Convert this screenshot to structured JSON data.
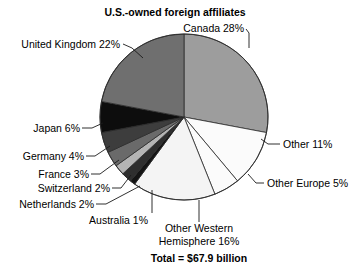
{
  "chart_data": {
    "type": "pie",
    "title": "U.S.-owned foreign affiliates",
    "total_label": "Total = $67.9 billion",
    "total_value": 67.9,
    "total_units": "billion dollars",
    "units": "percent",
    "start_angle_deg": 0,
    "direction": "clockwise",
    "categories": [
      "Canada",
      "Other",
      "Other Europe",
      "Other Western Hemisphere",
      "Australia",
      "Netherlands",
      "Switzerland",
      "France",
      "Germany",
      "Japan",
      "United Kingdom"
    ],
    "values": [
      28,
      11,
      5,
      16,
      1,
      2,
      2,
      3,
      4,
      6,
      22
    ],
    "slices": [
      {
        "name": "Canada",
        "value": 28,
        "label": "Canada 28%",
        "color": "#9d9d9d"
      },
      {
        "name": "Other",
        "value": 11,
        "label": "Other 11%",
        "color": "#fbfbfb"
      },
      {
        "name": "Other Europe",
        "value": 5,
        "label": "Other Europe 5%",
        "color": "#fbfbfb"
      },
      {
        "name": "Other Western Hemisphere",
        "value": 16,
        "label": "Other Western\nHemisphere 16%",
        "color": "#f4f4f4"
      },
      {
        "name": "Australia",
        "value": 1,
        "label": "Australia 1%",
        "color": "#141414"
      },
      {
        "name": "Netherlands",
        "value": 2,
        "label": "Netherlands 2%",
        "color": "#2e2e2e"
      },
      {
        "name": "Switzerland",
        "value": 2,
        "label": "Switzerland 2%",
        "color": "#b4b4b4"
      },
      {
        "name": "France",
        "value": 3,
        "label": "France 3%",
        "color": "#6a6a6a"
      },
      {
        "name": "Germany",
        "value": 4,
        "label": "Germany 4%",
        "color": "#3d3d3d"
      },
      {
        "name": "Japan",
        "value": 6,
        "label": "Japan 6%",
        "color": "#0d0d0d"
      },
      {
        "name": "United Kingdom",
        "value": 22,
        "label": "United Kingdom 22%",
        "color": "#6f6f6f"
      }
    ],
    "legend_position": "callout-labels",
    "grid": false,
    "xlabel": "",
    "ylabel": ""
  },
  "labels": {
    "title": "U.S.-owned foreign affiliates",
    "canada": "Canada 28%",
    "united_kingdom": "United Kingdom 22%",
    "japan": "Japan 6%",
    "germany": "Germany 4%",
    "france": "France 3%",
    "switzerland": "Switzerland 2%",
    "netherlands": "Netherlands 2%",
    "australia": "Australia 1%",
    "other_western_hemisphere_line1": "Other Western",
    "other_western_hemisphere_line2": "Hemisphere 16%",
    "other_europe": "Other Europe 5%",
    "other": "Other 11%",
    "total": "Total = $67.9 billion"
  },
  "colors": {
    "background": "#ffffff",
    "text": "#000000",
    "outline": "#2b2b2b",
    "leader": "#1a1a1a"
  }
}
